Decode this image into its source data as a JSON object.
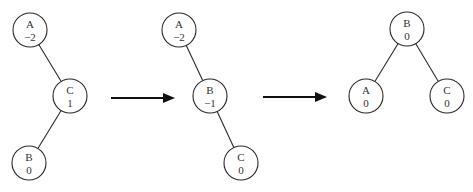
{
  "trees": [
    {
      "name": "initial",
      "nodes": [
        {
          "id": "A",
          "label": "A",
          "balance": "−2",
          "cx": 30,
          "cy": 30
        },
        {
          "id": "C",
          "label": "C",
          "balance": "1",
          "cx": 70,
          "cy": 96
        },
        {
          "id": "B",
          "label": "B",
          "balance": "0",
          "cx": 29,
          "cy": 163
        }
      ],
      "edges": [
        [
          "A",
          "C"
        ],
        [
          "C",
          "B"
        ]
      ]
    },
    {
      "name": "after-right-rotation",
      "nodes": [
        {
          "id": "A",
          "label": "A",
          "balance": "−2",
          "cx": 179,
          "cy": 30
        },
        {
          "id": "B",
          "label": "B",
          "balance": "−1",
          "cx": 210,
          "cy": 96
        },
        {
          "id": "C",
          "label": "C",
          "balance": "0",
          "cx": 241,
          "cy": 163
        }
      ],
      "edges": [
        [
          "A",
          "B"
        ],
        [
          "B",
          "C"
        ]
      ]
    },
    {
      "name": "balanced",
      "nodes": [
        {
          "id": "B",
          "label": "B",
          "balance": "0",
          "cx": 407,
          "cy": 29
        },
        {
          "id": "A",
          "label": "A",
          "balance": "0",
          "cx": 366,
          "cy": 96
        },
        {
          "id": "C",
          "label": "C",
          "balance": "0",
          "cx": 447,
          "cy": 96
        }
      ],
      "edges": [
        [
          "B",
          "A"
        ],
        [
          "B",
          "C"
        ]
      ]
    }
  ],
  "arrows": [
    {
      "x1": 111,
      "x2": 175,
      "y": 98
    },
    {
      "x1": 263,
      "x2": 327,
      "y": 97
    }
  ],
  "node_radius": 17
}
